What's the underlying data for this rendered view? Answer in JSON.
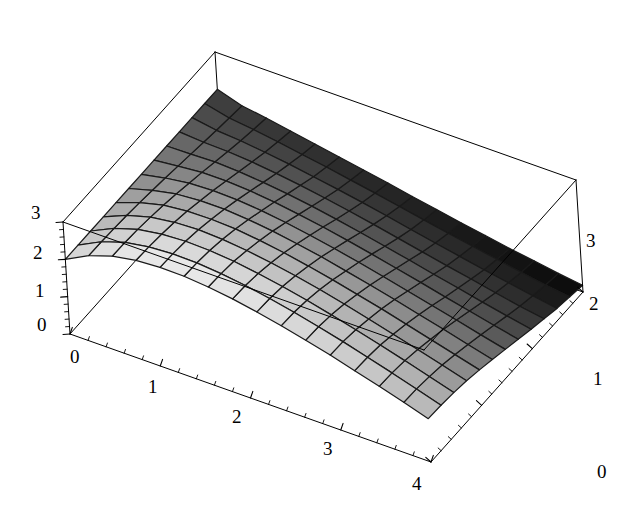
{
  "figure": {
    "kind": "surface-plot-3d",
    "background_color": "#ffffff",
    "frame_color": "#000000",
    "mesh_line_color": "#1a1a1a",
    "shade_light": "#efefef",
    "shade_dark": "#050505"
  },
  "axes": {
    "x": {
      "name": "x-axis",
      "ticks": [
        "0",
        "1",
        "2",
        "3",
        "4"
      ],
      "values": [
        0,
        1,
        2,
        3,
        4
      ],
      "range": [
        0,
        4
      ],
      "minor_per_major": 5
    },
    "y": {
      "name": "y-axis",
      "ticks": [
        "0",
        "1",
        "2",
        "3"
      ],
      "values": [
        0,
        1,
        2,
        3
      ],
      "range": [
        0,
        3
      ],
      "minor_per_major": 5
    },
    "z": {
      "name": "z-axis",
      "ticks": [
        "0",
        "1",
        "2",
        "3"
      ],
      "values": [
        0,
        1,
        2,
        3
      ],
      "range": [
        0,
        3
      ],
      "minor_per_major": 5
    }
  },
  "chart_data": {
    "type": "surface",
    "title": "",
    "xlabel": "",
    "ylabel": "",
    "zlabel": "",
    "xlim": [
      0,
      4
    ],
    "ylim": [
      0,
      3
    ],
    "zlim": [
      0,
      3
    ],
    "grid": false,
    "legend": "none",
    "colormap": "grayscale",
    "shading": "height-and-depth",
    "mesh": {
      "nx": 15,
      "ny": 12
    },
    "x": [
      0,
      0.2667,
      0.5333,
      0.8,
      1.0667,
      1.3333,
      1.6,
      1.8667,
      2.1333,
      2.4,
      2.6667,
      2.9333,
      3.2,
      3.4667,
      3.7333,
      4
    ],
    "y": [
      0,
      0.25,
      0.5,
      0.75,
      1,
      1.25,
      1.5,
      1.75,
      2,
      2.25,
      2.5,
      2.75,
      3
    ],
    "z_rows": [
      [
        2.0,
        2.0,
        2.0,
        2.0,
        2.0,
        2.0,
        2.0,
        2.0,
        2.0,
        2.0,
        2.0,
        2.0,
        2.0
      ],
      [
        2.33,
        2.32,
        2.3,
        2.27,
        2.23,
        2.18,
        2.13,
        2.07,
        2.01,
        1.95,
        1.89,
        1.84,
        1.79
      ],
      [
        2.54,
        2.53,
        2.5,
        2.45,
        2.39,
        2.31,
        2.22,
        2.13,
        2.03,
        1.93,
        1.84,
        1.76,
        1.69
      ],
      [
        2.66,
        2.64,
        2.6,
        2.54,
        2.46,
        2.36,
        2.25,
        2.13,
        2.0,
        1.88,
        1.76,
        1.66,
        1.57
      ],
      [
        2.7,
        2.68,
        2.64,
        2.57,
        2.47,
        2.36,
        2.23,
        2.09,
        1.94,
        1.8,
        1.67,
        1.55,
        1.45
      ],
      [
        2.69,
        2.67,
        2.62,
        2.54,
        2.44,
        2.31,
        2.17,
        2.02,
        1.86,
        1.71,
        1.56,
        1.44,
        1.33
      ],
      [
        2.63,
        2.61,
        2.56,
        2.47,
        2.36,
        2.23,
        2.08,
        1.92,
        1.76,
        1.6,
        1.45,
        1.32,
        1.21
      ],
      [
        2.54,
        2.52,
        2.46,
        2.37,
        2.26,
        2.12,
        1.97,
        1.81,
        1.64,
        1.48,
        1.33,
        1.2,
        1.09
      ],
      [
        2.42,
        2.4,
        2.34,
        2.25,
        2.13,
        2.0,
        1.84,
        1.68,
        1.51,
        1.35,
        1.2,
        1.07,
        0.96
      ],
      [
        2.28,
        2.26,
        2.2,
        2.11,
        1.99,
        1.85,
        1.7,
        1.54,
        1.37,
        1.21,
        1.06,
        0.94,
        0.84
      ],
      [
        2.12,
        2.1,
        2.04,
        1.95,
        1.83,
        1.7,
        1.55,
        1.39,
        1.23,
        1.07,
        0.93,
        0.81,
        0.71
      ],
      [
        1.95,
        1.93,
        1.87,
        1.78,
        1.67,
        1.54,
        1.39,
        1.24,
        1.08,
        0.93,
        0.8,
        0.69,
        0.6
      ],
      [
        1.76,
        1.74,
        1.69,
        1.6,
        1.49,
        1.37,
        1.23,
        1.08,
        0.94,
        0.8,
        0.67,
        0.57,
        0.48
      ],
      [
        1.57,
        1.55,
        1.5,
        1.42,
        1.31,
        1.2,
        1.07,
        0.93,
        0.79,
        0.66,
        0.55,
        0.45,
        0.38
      ],
      [
        1.37,
        1.35,
        1.3,
        1.23,
        1.13,
        1.02,
        0.9,
        0.78,
        0.65,
        0.53,
        0.43,
        0.34,
        0.27
      ],
      [
        1.16,
        1.14,
        1.1,
        1.04,
        0.95,
        0.85,
        0.74,
        0.63,
        0.52,
        0.42,
        0.32,
        0.25,
        0.18
      ]
    ]
  },
  "tick_labels": {
    "x": [
      {
        "text": "0",
        "left": 70,
        "top": 347
      },
      {
        "text": "1",
        "left": 148,
        "top": 377
      },
      {
        "text": "2",
        "left": 232,
        "top": 407
      },
      {
        "text": "3",
        "left": 323,
        "top": 439
      },
      {
        "text": "4",
        "left": 412,
        "top": 474
      }
    ],
    "y": [
      {
        "text": "0",
        "left": 597,
        "top": 462
      },
      {
        "text": "1",
        "left": 593,
        "top": 369
      },
      {
        "text": "2",
        "left": 589,
        "top": 294
      },
      {
        "text": "3",
        "left": 586,
        "top": 231
      }
    ],
    "z": [
      {
        "text": "0",
        "left": 37,
        "top": 315
      },
      {
        "text": "1",
        "left": 35,
        "top": 281
      },
      {
        "text": "2",
        "left": 33,
        "top": 243
      },
      {
        "text": "3",
        "left": 31,
        "top": 203
      }
    ]
  }
}
